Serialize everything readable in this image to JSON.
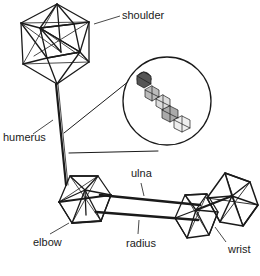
{
  "diagram": {
    "type": "arm-linkage-model",
    "colors": {
      "ink": "#1a1a1a",
      "background": "#ffffff"
    },
    "joints": [
      {
        "id": "shoulder",
        "label": "shoulder",
        "shape": "icosahedron"
      },
      {
        "id": "elbow",
        "label": "elbow",
        "shape": "icosahedron"
      },
      {
        "id": "wrist",
        "label": "wrist",
        "shape": "double-icosahedron"
      }
    ],
    "bones": [
      {
        "id": "humerus",
        "label": "humerus",
        "from": "shoulder",
        "to": "elbow"
      },
      {
        "id": "ulna",
        "label": "ulna",
        "from": "elbow",
        "to": "wrist"
      },
      {
        "id": "radius",
        "label": "radius",
        "from": "elbow",
        "to": "wrist"
      }
    ],
    "inset": {
      "description": "circular magnified view of the chain of icosahedra"
    },
    "labels": {
      "shoulder": "shoulder",
      "humerus": "humerus",
      "elbow": "elbow",
      "ulna": "ulna",
      "radius": "radius",
      "wrist": "wrist"
    }
  }
}
